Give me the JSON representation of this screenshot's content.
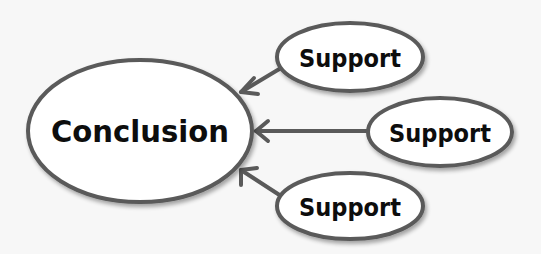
{
  "diagram": {
    "conclusion": {
      "label": "Conclusion",
      "cx": 140,
      "cy": 131,
      "rx": 112,
      "ry": 71
    },
    "supports": [
      {
        "label": "Support",
        "cx": 350,
        "cy": 57,
        "rx": 73,
        "ry": 35
      },
      {
        "label": "Support",
        "cx": 440,
        "cy": 132,
        "rx": 72,
        "ry": 35
      },
      {
        "label": "Support",
        "cx": 350,
        "cy": 206,
        "rx": 73,
        "ry": 34
      }
    ],
    "edges": [
      {
        "from": "support-1",
        "to": "conclusion"
      },
      {
        "from": "support-2",
        "to": "conclusion"
      },
      {
        "from": "support-3",
        "to": "conclusion"
      }
    ],
    "colors": {
      "stroke": "#5a5a5a",
      "fill": "#ffffff",
      "text": "#0d0d0d",
      "background": "#f7f7f7"
    }
  }
}
